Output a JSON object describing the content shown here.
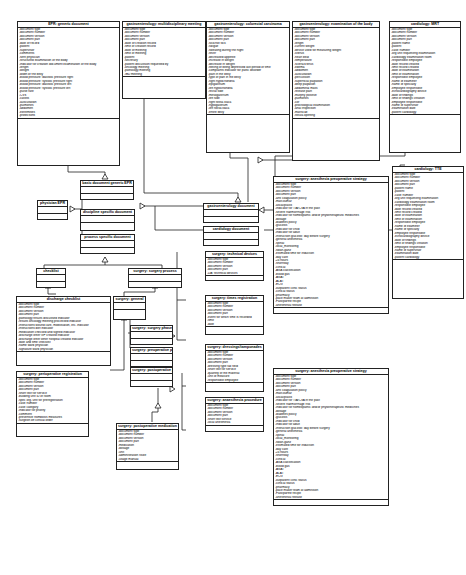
{
  "classes": {
    "epr_generic": {
      "title": "EPR: generic document",
      "attrs": [
        "-document type",
        "-document number",
        "-document version",
        "-document part",
        "-date of record",
        "-patient",
        "-supervisor",
        "-comments",
        "-sent physician",
        "-structured examination of the body",
        "-indicator for creation document examination of the body",
        "-length",
        "-weight",
        "-width of the belly",
        "-blood pressure: diastolic pressure right",
        "-blood pressure: systolic pressure right",
        "-blood pressure: diastolic pressure left",
        "-blood pressure: systolic pressure left",
        "-pulse rate",
        "-CVS",
        "-carotis",
        "-auscultation",
        "-pulmones",
        "-abdomen",
        "-extremities",
        "-protections"
      ]
    },
    "gastro_mdm": {
      "title": "gastroenterology: multidisciplinary meeting",
      "attrs": [
        "-document type",
        "-document number",
        "-document version",
        "-document part",
        "-date of creation record",
        "-time of creation record",
        "-date of meeting",
        "-time of meeting",
        "-patient",
        "-secretary",
        "-patient discussion requested by",
        "-oncology meeting",
        "-pathology meeting",
        "-IBD meeting"
      ]
    },
    "gastro_crc": {
      "title": "gastroenterology: colorectal carcinoma",
      "attrs": [
        "-document type",
        "-document number",
        "-document version",
        "-document part",
        "-sick/not sick",
        "-fatigue",
        "-sweating during the night",
        "-fever",
        "-decreased appetite",
        "-increase in weight",
        "-decrease in weight",
        "-feeling of being depressed last period of time",
        "-complaints indicator for panic disorder",
        "-pain in the belly",
        "-type of pain in the belly",
        "-right hypochondria",
        "-epigastrium",
        "-left hypochondria",
        "-rectal side",
        "-mesogastrium",
        "-left side",
        "-right fossa iliaca",
        "-hypogastrium",
        "-left fossa iliaca",
        "-entire belly"
      ]
    },
    "gastro_exam": {
      "title": "gastroenterology: examination of the body",
      "attrs": [
        "-document type",
        "-document number",
        "-document version",
        "-document part",
        "-length",
        "-current weight",
        "-device used for measuring weight",
        "-icterus",
        "-heart beat",
        "-temperature",
        "-sclera/icterus",
        "-edema",
        "-abdomen",
        "-auscultation",
        "-percussion",
        "-superficial palpation",
        "-deep palpation",
        "-abdominal mass",
        "-release pain",
        "-murphy positive",
        "-pulmones",
        "-cor",
        "-proctological examination",
        "-anal inspection",
        "-mariscae",
        "-fistula opening"
      ]
    },
    "cardio_mri": {
      "title": "cardiology: MRT",
      "attrs": [
        "-document type",
        "-document number",
        "-document version",
        "-document part",
        "-patient name",
        "-patient",
        "-case number",
        "-org unit requesting examination",
        "-cardiology examination room",
        "-responsible employee",
        "-date record created",
        "-time record created",
        "-date of examination",
        "-time of examination",
        "-responsible employee",
        "-name of examiner",
        "-name of specialty",
        "-employee responsible",
        "-echocardiography device",
        "-date of findings",
        "-time of findings creation",
        "-employee responsible",
        "-name of supervisor",
        "-examination date",
        "-patient cardiology"
      ]
    },
    "cardio_tte": {
      "title": "cardiology: TTE",
      "attrs": [
        "-document type",
        "-document number",
        "-document version",
        "-document part",
        "-patient name",
        "-patient",
        "-case number",
        "-org unit requesting examination",
        "-cardiology examination room",
        "-responsible employee",
        "-date record created",
        "-time record created",
        "-date of examination",
        "-time of examination",
        "-responsible employee",
        "-name of examiner",
        "-name of specialty",
        "-employee responsible",
        "-echocardiography device",
        "-date of findings",
        "-time of findings creation",
        "-employee responsible",
        "-name of supervisor",
        "-examination date",
        "-patient cardiology"
      ]
    },
    "basic_doc": {
      "title": "basic document generic EPR",
      "attrs": []
    },
    "physician_epr": {
      "title": "physician EPR",
      "attrs": []
    },
    "discipline_doc": {
      "title": "discipline specific document",
      "attrs": []
    },
    "process_doc": {
      "title": "process specific document",
      "attrs": []
    },
    "gastro_doc": {
      "title": "gastroenterology document",
      "attrs": []
    },
    "cardio_doc": {
      "title": "cardiology document",
      "attrs": []
    },
    "checklist": {
      "title": "checklist",
      "attrs": []
    },
    "discharge_checklist": {
      "title": "discharge checklist",
      "attrs": [
        "-document type",
        "-document number",
        "-document version",
        "-document part",
        "-pathology results discussed indicator",
        "-results oncology meeting processed indicator",
        "-instructions wound care, mobilisation, etc. indicator",
        "-instructions diet indicator",
        "-medication checked and signed indicator",
        "-discharge letter GP created indicator",
        "-discharge letter other hospital created indicator",
        "-date and time checklist",
        "-name ward physician",
        "-signature ward physician"
      ]
    },
    "surgery_process": {
      "title": "surgery: surgery process",
      "attrs": []
    },
    "surgery_general": {
      "title": "surgery: general",
      "attrs": []
    },
    "surgery_phase": {
      "title": "surgery: surgery phase",
      "attrs": []
    },
    "surgery_preop_phase": {
      "title": "surgery: preoperative phase",
      "attrs": []
    },
    "surgery_postop_phase": {
      "title": "surgery: postoperative phase",
      "attrs": []
    },
    "surgery_tech": {
      "title": "surgery: technical devices",
      "attrs": [
        "-document type",
        "-document number",
        "-document version",
        "-document part",
        "-DA: technical devices"
      ]
    },
    "surgery_time": {
      "title": "surgery: times registration",
      "attrs": [
        "-document type",
        "-document number",
        "-document version",
        "-document part",
        "-event for which time is recorded",
        "-time",
        "-date"
      ]
    },
    "surgery_dress": {
      "title": "surgery: dressings/tamponades",
      "attrs": [
        "-document type",
        "-document number",
        "-document version",
        "-document part",
        "-dressing type tax field",
        "-short text for service",
        "-quantity of the material",
        "-unit of measure",
        "-responsible employee"
      ]
    },
    "surgery_anesth_proc": {
      "title": "surgery: anaesthesia procedure",
      "attrs": [
        "-document type",
        "-document number",
        "-document version",
        "-document part",
        "-short text service",
        "-local anesthesia"
      ]
    },
    "surgery_periop_reg": {
      "title": "surgery: perioperative registration",
      "attrs": [
        "-document type",
        "-document number",
        "-document version",
        "-document part",
        "-short text for service",
        "-building unit ID of room",
        "-spec org. unit for preregistration",
        "-case number",
        "-case category",
        "-indicator for priority",
        "-comment",
        "-preventive trombosis measures",
        "-surgeon off clinical order"
      ]
    },
    "surgery_postop_med": {
      "title": "surgery: postoperative medication",
      "attrs": [
        "-document type",
        "-document number",
        "-document version",
        "-document part",
        "-medication",
        "-dosage",
        "-unit",
        "-administration route",
        "-usage manual"
      ]
    },
    "anesth_preop_1": {
      "title": "surgery: anesthesia preoperative strategy",
      "attrs": [
        "-document type",
        "-document number",
        "-document version",
        "-document part",
        "-anti coagulation policy",
        "-marcoumar",
        "-ascal/plavix",
        "-indicator for TIA/CVA in the past",
        "-severe haemorrhage risk",
        "-indicator for homeopathic and/or phytotherapeutic medicines",
        "-dosage",
        "-diabetes policy",
        "-glucosis",
        "-indicator for child",
        "-indicator for adult",
        "-instruction glucosis: day before surgery",
        "-general anesthesia",
        "-spinal",
        "-local_monitoring",
        "-swan-ganz",
        "-estimated time for induction",
        "-day care",
        "-24 hours",
        "-shortstay",
        "-clinical",
        "-ASA classification",
        "-blood gas",
        "-ASAT",
        "-ALAT",
        "-ECG",
        "-outpatient clinic status",
        "-clinical status",
        "-pharmacy",
        "-pace maker team at admission",
        "-Fast/parthe recipe",
        "-anesthesia release"
      ]
    },
    "anesth_preop_2": {
      "title": "surgery: anesthesia preoperative strategy",
      "attrs": [
        "-document type",
        "-document number",
        "-document version",
        "-document part",
        "-anti coagulation policy",
        "-marcoumar",
        "-ascal/plavix",
        "-indicator for TIA/CVA in the past",
        "-severe haemorrhage risk",
        "-indicator for homeopathic and/or phytotherapeutic medicines",
        "-dosage",
        "-diabetes policy",
        "-glucosis",
        "-indicator for child",
        "-indicator for adult",
        "-instruction glucosis: day before surgery",
        "-general anesthesia",
        "-spinal",
        "-local_monitoring",
        "-swan-ganz",
        "-estimated time for induction",
        "-day care",
        "-24 hours",
        "-shortstay",
        "-clinical",
        "-ASA classification",
        "-blood gas",
        "-ASAT",
        "-ALAT",
        "-ECG",
        "-outpatient clinic status",
        "-clinical status",
        "-pharmacy",
        "-pace maker team at admission",
        "-Fast/parthe recipe",
        "-anesthesia release"
      ]
    }
  }
}
